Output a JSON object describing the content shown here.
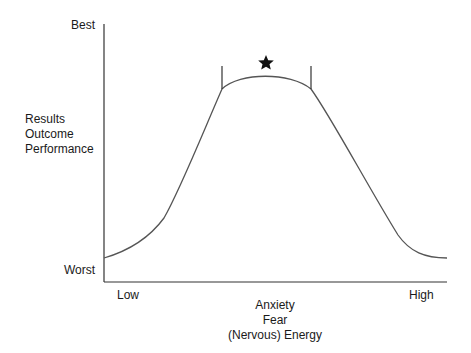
{
  "diagram": {
    "title": "",
    "y_axis": {
      "top_label": "Best",
      "bottom_label": "Worst",
      "title_lines": [
        "Results",
        "Outcome",
        "Performance"
      ]
    },
    "x_axis": {
      "left_label": "Low",
      "right_label": "High",
      "title_lines": [
        "Anxiety",
        "Fear",
        "(Nervous) Energy"
      ]
    },
    "optimal_zone_marker": "star-icon",
    "colors": {
      "curve": "#555555",
      "axis": "#333333",
      "star": "#111111",
      "background": "#ffffff"
    }
  }
}
